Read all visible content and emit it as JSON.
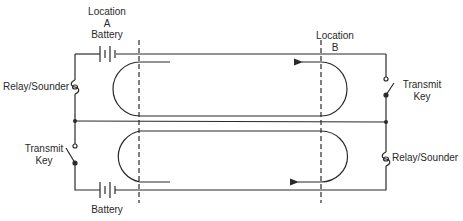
{
  "diagram": {
    "location_a": {
      "line1": "Location",
      "line2": "A"
    },
    "location_b": {
      "line1": "Location",
      "line2": "B"
    },
    "battery_top_label": "Battery",
    "battery_bottom_label": "Battery",
    "relay_left_label": "Relay/Sounder",
    "relay_right_label": "Relay/Sounder",
    "key_right": {
      "line1": "Transmit",
      "line2": "Key"
    },
    "key_left": {
      "line1": "Transmit",
      "line2": "Key"
    },
    "colors": {
      "line": "#2a2a2a",
      "background": "#ffffff"
    }
  }
}
